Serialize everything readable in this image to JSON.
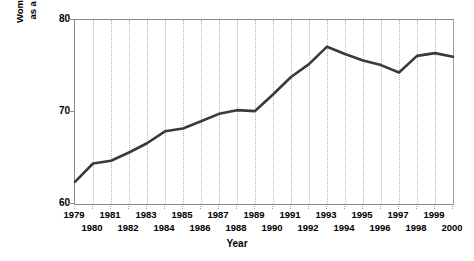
{
  "chart_data": {
    "type": "line",
    "title": "",
    "xlabel": "Year",
    "ylabel": "Women's Weekly Earnings as a Percentage of Men's",
    "ylabel_lines": [
      "Women's Weekly Earnings",
      "as a Percentage of Men's"
    ],
    "ylim": [
      60,
      80
    ],
    "y_ticks": [
      60,
      70,
      80
    ],
    "y_tick_labels": [
      "60",
      "70",
      "80"
    ],
    "xlim": [
      1979,
      2000
    ],
    "grid": "vertical-dotted",
    "legend": "none",
    "series_color": "#3a3a3a",
    "grid_color": "#b4b4b4",
    "axis_color": "#8a8a8a",
    "x": [
      1979,
      1980,
      1981,
      1982,
      1983,
      1984,
      1985,
      1986,
      1987,
      1988,
      1989,
      1990,
      1991,
      1992,
      1993,
      1994,
      1995,
      1996,
      1997,
      1998,
      1999,
      2000
    ],
    "categories": [
      "1979",
      "1980",
      "1981",
      "1982",
      "1983",
      "1984",
      "1985",
      "1986",
      "1987",
      "1988",
      "1989",
      "1990",
      "1991",
      "1992",
      "1993",
      "1994",
      "1995",
      "1996",
      "1997",
      "1998",
      "1999",
      "2000"
    ],
    "values": [
      62.4,
      64.4,
      64.7,
      65.6,
      66.6,
      67.9,
      68.2,
      69.0,
      69.8,
      70.2,
      70.1,
      71.9,
      73.8,
      75.2,
      77.1,
      76.3,
      75.6,
      75.1,
      74.3,
      76.1,
      76.4,
      76.0
    ],
    "x_labels_top_row": [
      "1979",
      "1981",
      "1983",
      "1985",
      "1987",
      "1989",
      "1991",
      "1993",
      "1995",
      "1997",
      "1999"
    ],
    "x_labels_bottom_row": [
      "1980",
      "1982",
      "1984",
      "1986",
      "1988",
      "1990",
      "1992",
      "1994",
      "1996",
      "1998",
      "2000"
    ]
  }
}
